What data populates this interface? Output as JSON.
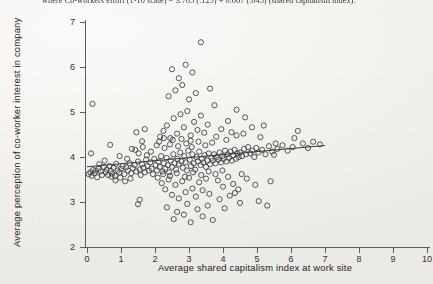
{
  "page": {
    "headline_text": "where Co-workers effort (1-10 scale) = 3.785 (.125) + 0.067 (.045) (shared capitalism index).",
    "background_color": "#f2f1ee",
    "ink_color": "#3b3b3b"
  },
  "chart_data": {
    "type": "scatter",
    "title": "",
    "xlabel": "Average shared capitalism index at work site",
    "ylabel": "Average perception of co-worker interest in company",
    "xlim": [
      -0.35,
      10.2
    ],
    "ylim": [
      1.85,
      7.25
    ],
    "xticks": [
      0,
      1,
      2,
      3,
      4,
      5,
      6,
      7,
      8,
      9,
      10
    ],
    "xticklabels": [
      "0",
      "1",
      "2",
      "3",
      "4",
      "5",
      "6",
      "7",
      "8",
      "9",
      "10"
    ],
    "yticks": [
      2,
      3,
      4,
      5,
      6,
      7
    ],
    "yticklabels": [
      "2",
      "3",
      "4",
      "5",
      "6",
      "7"
    ],
    "grid": false,
    "legend": null,
    "marker": "open-circle",
    "marker_size": 3.4,
    "fit_line": {
      "label": "linear fit",
      "intercept": 3.785,
      "slope": 0.067,
      "x_start": 0.0,
      "x_end": 7.0,
      "y_start": 3.785,
      "y_end": 4.254
    },
    "points": [
      [
        0.05,
        3.62
      ],
      [
        0.1,
        3.66
      ],
      [
        0.14,
        3.58
      ],
      [
        0.18,
        3.71
      ],
      [
        0.22,
        3.64
      ],
      [
        0.26,
        3.7
      ],
      [
        0.3,
        3.55
      ],
      [
        0.34,
        3.74
      ],
      [
        0.4,
        3.68
      ],
      [
        0.44,
        3.6
      ],
      [
        0.12,
        4.08
      ],
      [
        0.16,
        5.18
      ],
      [
        0.5,
        3.78
      ],
      [
        0.55,
        3.66
      ],
      [
        0.58,
        3.72
      ],
      [
        0.62,
        3.6
      ],
      [
        0.66,
        3.8
      ],
      [
        0.7,
        3.69
      ],
      [
        0.74,
        3.63
      ],
      [
        0.78,
        3.76
      ],
      [
        0.82,
        3.58
      ],
      [
        0.86,
        3.85
      ],
      [
        0.9,
        3.7
      ],
      [
        0.95,
        3.66
      ],
      [
        1.0,
        3.74
      ],
      [
        0.68,
        4.27
      ],
      [
        1.05,
        3.8
      ],
      [
        1.1,
        3.62
      ],
      [
        1.15,
        3.77
      ],
      [
        1.2,
        3.7
      ],
      [
        1.25,
        3.86
      ],
      [
        1.3,
        3.64
      ],
      [
        1.35,
        3.75
      ],
      [
        1.4,
        3.82
      ],
      [
        1.45,
        3.68
      ],
      [
        1.5,
        3.9
      ],
      [
        1.55,
        3.72
      ],
      [
        1.58,
        3.6
      ],
      [
        1.62,
        3.84
      ],
      [
        1.66,
        3.76
      ],
      [
        1.7,
        3.66
      ],
      [
        1.74,
        3.94
      ],
      [
        1.78,
        3.8
      ],
      [
        1.82,
        3.7
      ],
      [
        1.86,
        3.88
      ],
      [
        1.9,
        3.74
      ],
      [
        1.94,
        3.62
      ],
      [
        1.98,
        3.96
      ],
      [
        2.02,
        3.82
      ],
      [
        2.06,
        3.7
      ],
      [
        1.45,
        4.55
      ],
      [
        1.5,
        2.95
      ],
      [
        1.55,
        3.05
      ],
      [
        1.62,
        4.35
      ],
      [
        1.7,
        4.62
      ],
      [
        2.1,
        3.9
      ],
      [
        2.14,
        3.78
      ],
      [
        2.18,
        4.02
      ],
      [
        2.22,
        3.68
      ],
      [
        2.26,
        3.86
      ],
      [
        2.3,
        3.74
      ],
      [
        2.34,
        3.98
      ],
      [
        2.38,
        3.82
      ],
      [
        2.42,
        3.66
      ],
      [
        2.46,
        3.92
      ],
      [
        2.5,
        3.78
      ],
      [
        2.54,
        4.06
      ],
      [
        2.58,
        3.86
      ],
      [
        2.62,
        3.72
      ],
      [
        2.66,
        3.96
      ],
      [
        2.7,
        3.84
      ],
      [
        2.74,
        4.1
      ],
      [
        2.78,
        3.9
      ],
      [
        2.82,
        3.76
      ],
      [
        2.86,
        4.02
      ],
      [
        2.9,
        3.88
      ],
      [
        2.94,
        3.7
      ],
      [
        2.98,
        4.14
      ],
      [
        3.02,
        3.94
      ],
      [
        3.06,
        3.8
      ],
      [
        3.1,
        4.06
      ],
      [
        3.14,
        3.86
      ],
      [
        3.18,
        3.72
      ],
      [
        3.22,
        4.0
      ],
      [
        3.26,
        3.9
      ],
      [
        3.3,
        4.12
      ],
      [
        3.34,
        3.82
      ],
      [
        3.38,
        3.96
      ],
      [
        3.42,
        3.88
      ],
      [
        3.46,
        4.04
      ],
      [
        3.5,
        3.78
      ],
      [
        3.54,
        3.92
      ],
      [
        3.58,
        4.08
      ],
      [
        3.62,
        3.84
      ],
      [
        3.66,
        3.98
      ],
      [
        2.15,
        4.45
      ],
      [
        2.25,
        4.58
      ],
      [
        2.35,
        4.7
      ],
      [
        2.45,
        4.42
      ],
      [
        2.55,
        4.86
      ],
      [
        2.65,
        4.52
      ],
      [
        2.75,
        4.95
      ],
      [
        2.85,
        4.66
      ],
      [
        2.95,
        5.02
      ],
      [
        3.05,
        4.48
      ],
      [
        3.15,
        4.78
      ],
      [
        3.25,
        4.6
      ],
      [
        3.35,
        4.92
      ],
      [
        3.45,
        4.54
      ],
      [
        3.55,
        4.72
      ],
      [
        2.4,
        5.35
      ],
      [
        2.6,
        5.48
      ],
      [
        2.8,
        5.6
      ],
      [
        3.0,
        5.28
      ],
      [
        3.2,
        5.42
      ],
      [
        2.5,
        5.95
      ],
      [
        2.9,
        6.05
      ],
      [
        3.35,
        6.55
      ],
      [
        2.7,
        5.75
      ],
      [
        3.1,
        5.88
      ],
      [
        2.2,
        3.42
      ],
      [
        2.3,
        3.28
      ],
      [
        2.4,
        3.5
      ],
      [
        2.5,
        3.16
      ],
      [
        2.6,
        3.38
      ],
      [
        2.7,
        3.08
      ],
      [
        2.8,
        3.46
      ],
      [
        2.9,
        3.22
      ],
      [
        3.0,
        3.54
      ],
      [
        3.1,
        3.3
      ],
      [
        3.2,
        3.12
      ],
      [
        3.3,
        3.44
      ],
      [
        3.4,
        3.26
      ],
      [
        3.5,
        3.52
      ],
      [
        3.6,
        3.18
      ],
      [
        2.35,
        2.88
      ],
      [
        2.65,
        2.78
      ],
      [
        2.95,
        2.96
      ],
      [
        3.25,
        2.84
      ],
      [
        3.55,
        2.92
      ],
      [
        2.55,
        2.62
      ],
      [
        3.05,
        2.55
      ],
      [
        3.4,
        2.68
      ],
      [
        2.85,
        2.72
      ],
      [
        3.7,
        2.6
      ],
      [
        3.7,
        3.92
      ],
      [
        3.74,
        4.06
      ],
      [
        3.78,
        3.86
      ],
      [
        3.82,
        4.0
      ],
      [
        3.86,
        3.94
      ],
      [
        3.9,
        4.1
      ],
      [
        3.94,
        3.88
      ],
      [
        3.98,
        4.02
      ],
      [
        4.02,
        3.96
      ],
      [
        4.06,
        4.14
      ],
      [
        4.1,
        3.9
      ],
      [
        4.14,
        4.06
      ],
      [
        4.18,
        3.98
      ],
      [
        4.22,
        4.12
      ],
      [
        4.26,
        3.92
      ],
      [
        4.3,
        4.04
      ],
      [
        4.34,
        4.16
      ],
      [
        4.38,
        3.96
      ],
      [
        4.42,
        4.08
      ],
      [
        4.46,
        4.0
      ],
      [
        3.8,
        4.45
      ],
      [
        3.95,
        4.62
      ],
      [
        4.1,
        4.38
      ],
      [
        4.25,
        4.55
      ],
      [
        4.4,
        4.48
      ],
      [
        3.85,
        3.48
      ],
      [
        4.0,
        3.34
      ],
      [
        4.15,
        3.56
      ],
      [
        4.3,
        3.4
      ],
      [
        4.45,
        3.28
      ],
      [
        3.9,
        3.06
      ],
      [
        4.2,
        3.14
      ],
      [
        4.5,
        2.98
      ],
      [
        4.05,
        2.86
      ],
      [
        4.35,
        3.2
      ],
      [
        4.5,
        4.1
      ],
      [
        4.56,
        4.02
      ],
      [
        4.62,
        4.18
      ],
      [
        4.68,
        4.06
      ],
      [
        4.74,
        4.22
      ],
      [
        4.8,
        4.08
      ],
      [
        4.86,
        4.14
      ],
      [
        4.92,
        4.0
      ],
      [
        4.98,
        4.2
      ],
      [
        5.04,
        4.1
      ],
      [
        4.6,
        4.52
      ],
      [
        4.85,
        4.66
      ],
      [
        5.1,
        4.44
      ],
      [
        4.7,
        3.52
      ],
      [
        4.95,
        3.38
      ],
      [
        5.15,
        4.16
      ],
      [
        5.25,
        4.06
      ],
      [
        5.35,
        4.24
      ],
      [
        5.45,
        4.12
      ],
      [
        5.55,
        4.3
      ],
      [
        5.2,
        4.7
      ],
      [
        5.4,
        3.46
      ],
      [
        5.6,
        4.18
      ],
      [
        5.75,
        4.26
      ],
      [
        5.9,
        4.14
      ],
      [
        6.05,
        4.22
      ],
      [
        6.2,
        4.58
      ],
      [
        6.35,
        4.3
      ],
      [
        6.5,
        4.2
      ],
      [
        6.65,
        4.34
      ],
      [
        5.05,
        3.02
      ],
      [
        5.3,
        2.92
      ],
      [
        4.55,
        3.62
      ],
      [
        4.4,
        5.05
      ],
      [
        3.75,
        5.15
      ],
      [
        1.32,
        4.18
      ],
      [
        1.18,
        3.96
      ],
      [
        0.96,
        4.02
      ],
      [
        0.52,
        3.92
      ],
      [
        0.36,
        3.84
      ],
      [
        2.05,
        4.26
      ],
      [
        2.12,
        4.34
      ],
      [
        2.28,
        4.2
      ],
      [
        2.44,
        4.28
      ],
      [
        2.68,
        4.24
      ],
      [
        2.92,
        4.3
      ],
      [
        3.08,
        4.22
      ],
      [
        3.28,
        4.34
      ],
      [
        3.48,
        4.26
      ],
      [
        3.68,
        4.32
      ],
      [
        2.08,
        3.54
      ],
      [
        2.24,
        3.62
      ],
      [
        2.44,
        3.58
      ],
      [
        2.64,
        3.64
      ],
      [
        2.88,
        3.56
      ],
      [
        3.12,
        3.66
      ],
      [
        3.36,
        3.6
      ],
      [
        3.58,
        3.68
      ],
      [
        3.78,
        3.62
      ],
      [
        3.98,
        3.7
      ],
      [
        1.88,
        4.12
      ],
      [
        1.76,
        4.04
      ],
      [
        1.64,
        4.22
      ],
      [
        1.52,
        4.08
      ],
      [
        1.42,
        4.16
      ],
      [
        1.28,
        3.52
      ],
      [
        1.12,
        3.46
      ],
      [
        0.98,
        3.54
      ],
      [
        0.84,
        3.48
      ],
      [
        0.72,
        3.56
      ],
      [
        4.65,
        4.88
      ],
      [
        5.5,
        4.05
      ],
      [
        6.85,
        4.28
      ],
      [
        6.1,
        4.42
      ],
      [
        4.15,
        4.8
      ],
      [
        3.62,
        5.52
      ],
      [
        3.05,
        4.36
      ],
      [
        2.78,
        4.4
      ],
      [
        2.52,
        4.38
      ],
      [
        2.26,
        4.42
      ]
    ]
  }
}
